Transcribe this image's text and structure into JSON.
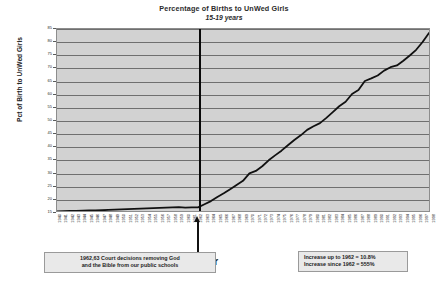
{
  "chart_data": {
    "type": "line",
    "title": "Percentage of Births to UnWed Girls",
    "subtitle": "15-19 years",
    "xlabel": "Year",
    "ylabel": "Pct of Birth to UnWed Girls",
    "ylim": [
      15,
      85
    ],
    "ytick_step": 5,
    "grid": true,
    "legend": "none",
    "yticks": [
      85,
      80,
      75,
      70,
      65,
      60,
      55,
      50,
      45,
      40,
      35,
      30,
      25,
      20,
      15
    ],
    "x": [
      1940,
      1941,
      1942,
      1943,
      1944,
      1945,
      1946,
      1947,
      1948,
      1949,
      1950,
      1951,
      1952,
      1953,
      1954,
      1955,
      1956,
      1957,
      1958,
      1959,
      1960,
      1961,
      1962,
      1963,
      1964,
      1965,
      1966,
      1967,
      1968,
      1969,
      1970,
      1971,
      1972,
      1973,
      1974,
      1975,
      1976,
      1977,
      1978,
      1979,
      1980,
      1981,
      1982,
      1983,
      1984,
      1985,
      1986,
      1987,
      1988,
      1989,
      1990,
      1991,
      1992,
      1993,
      1994,
      1995,
      1996,
      1997,
      1998
    ],
    "values": [
      14.8,
      14.9,
      15.0,
      15.0,
      15.1,
      15.2,
      15.2,
      15.3,
      15.4,
      15.5,
      15.6,
      15.7,
      15.8,
      15.9,
      16.0,
      16.1,
      16.2,
      16.3,
      16.4,
      16.5,
      16.3,
      16.4,
      16.4,
      17.6,
      18.8,
      20.4,
      21.8,
      23.4,
      25.0,
      26.6,
      29.5,
      30.4,
      32.2,
      34.5,
      36.4,
      38.2,
      40.3,
      42.3,
      44.1,
      46.2,
      47.6,
      48.8,
      50.8,
      53.0,
      55.3,
      57.0,
      60.0,
      61.5,
      65.0,
      66.0,
      67.1,
      69.0,
      70.3,
      71.0,
      72.8,
      74.8,
      77.0,
      80.0,
      83.5
    ],
    "event_marker": {
      "year": 1962,
      "label": "1962,63 Court decisions removing God and the Bible from our public schools"
    },
    "annotations": {
      "left_box": {
        "line1": "1962,63 Court decisions removing God",
        "line2": "and the Bible from our public schools"
      },
      "right_box": {
        "line1": "Increase up to 1962 = 10.8%",
        "line2": "Increase since 1962 = 555%"
      }
    },
    "colors": {
      "plot_background": "#d2d2d2",
      "gridline": "#6f6f6f",
      "line": "#111111",
      "event_line": "#0a0a0a",
      "callout_background": "#e9e9e9"
    }
  }
}
